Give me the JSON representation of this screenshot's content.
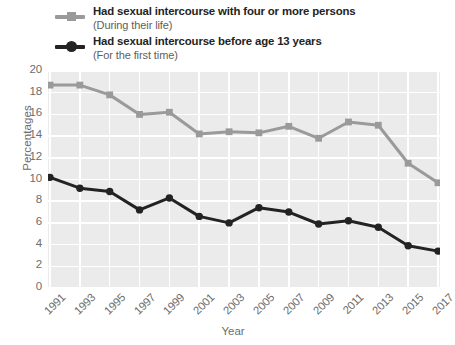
{
  "chart_data": {
    "type": "line",
    "title": "",
    "xlabel": "Year",
    "ylabel": "Percentages",
    "xlim": [
      1991,
      2017
    ],
    "ylim": [
      0,
      20
    ],
    "ytick_step": 2,
    "grid": true,
    "legend_position": "above-plot",
    "x": [
      1991,
      1993,
      1995,
      1997,
      1999,
      2001,
      2003,
      2005,
      2007,
      2009,
      2011,
      2013,
      2015,
      2017
    ],
    "xtick_labels": [
      "1991",
      "1993",
      "1995",
      "1997",
      "1999",
      "2001",
      "2003",
      "2005",
      "2007",
      "2009",
      "2011",
      "2013",
      "2015",
      "2017"
    ],
    "ytick_labels": [
      "0",
      "2",
      "4",
      "6",
      "8",
      "10",
      "12",
      "14",
      "16",
      "18",
      "20"
    ],
    "series": [
      {
        "name": "Had sexual intercourse with four or more persons",
        "sublabel": "(During their life)",
        "color": "#9a9a9a",
        "marker": "square",
        "values": [
          18.7,
          18.7,
          17.8,
          16.0,
          16.2,
          14.2,
          14.4,
          14.3,
          14.9,
          13.8,
          15.3,
          15.0,
          11.5,
          9.7
        ]
      },
      {
        "name": "Had sexual intercourse before age 13 years",
        "sublabel": "(For the first time)",
        "color": "#232323",
        "marker": "circle",
        "values": [
          10.2,
          9.2,
          8.9,
          7.2,
          8.3,
          6.6,
          6.0,
          7.4,
          7.0,
          5.9,
          6.2,
          5.6,
          3.9,
          3.4
        ]
      }
    ]
  },
  "legend": [
    {
      "label": "Had sexual intercourse with four or more persons",
      "sublabel": "(During their life)",
      "color": "#9a9a9a",
      "marker": "square-marker-icon"
    },
    {
      "label": "Had sexual intercourse before age 13 years",
      "sublabel": "(For the first time)",
      "color": "#232323",
      "marker": "circle-marker-icon"
    }
  ],
  "axes": {
    "x_title": "Year",
    "y_title": "Percentages"
  }
}
